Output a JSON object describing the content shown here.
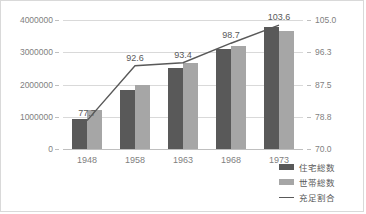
{
  "chart_data": {
    "type": "bar",
    "title": "",
    "xlabel": "",
    "ylabel": "",
    "grid": true,
    "legend_position": "bottom-right",
    "categories": [
      "1948",
      "1958",
      "1963",
      "1968",
      "1973"
    ],
    "left_axis": {
      "ticks": [
        "0",
        "1000000",
        "2000000",
        "3000000",
        "4000000"
      ],
      "values": [
        0,
        1000000,
        2000000,
        3000000,
        4000000
      ],
      "ylim": [
        0,
        4000000
      ]
    },
    "right_axis": {
      "ticks": [
        "70.0",
        "78.8",
        "87.5",
        "96.3",
        "105.0"
      ],
      "values": [
        70.0,
        78.8,
        87.5,
        96.3,
        105.0
      ],
      "ylim": [
        70.0,
        105.0
      ]
    },
    "series": [
      {
        "name": "住宅総数",
        "kind": "bar",
        "axis": "left",
        "color": "#595959",
        "values": [
          930000,
          1820000,
          2520000,
          3110000,
          3790000
        ]
      },
      {
        "name": "世帯総数",
        "kind": "bar",
        "axis": "left",
        "color": "#a6a6a6",
        "values": [
          1200000,
          1970000,
          2680000,
          3180000,
          3660000
        ]
      },
      {
        "name": "充足割合",
        "kind": "line",
        "axis": "right",
        "color": "#595959",
        "values": [
          77.7,
          92.6,
          93.4,
          98.7,
          103.6
        ],
        "data_labels": [
          "77.7",
          "92.6",
          "93.4",
          "98.7",
          "103.6"
        ]
      }
    ]
  }
}
